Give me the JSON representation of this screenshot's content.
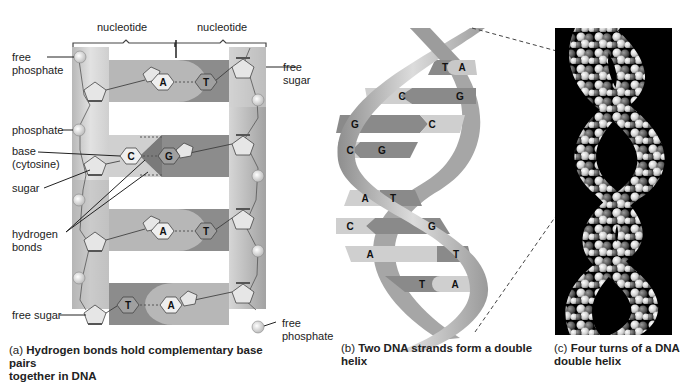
{
  "panel_a": {
    "header_labels": [
      "nucleotide",
      "nucleotide"
    ],
    "left_labels": {
      "free_phosphate": [
        "free",
        "phosphate"
      ],
      "phosphate": "phosphate",
      "base": [
        "base",
        "(cytosine)"
      ],
      "sugar": "sugar",
      "hydrogen_bonds": [
        "hydrogen",
        "bonds"
      ],
      "free_sugar": "free sugar"
    },
    "right_labels": {
      "free_sugar": [
        "free",
        "sugar"
      ],
      "free_phosphate": [
        "free",
        "phosphate"
      ]
    },
    "base_pairs": [
      {
        "left": "A",
        "right": "T"
      },
      {
        "left": "C",
        "right": "G"
      },
      {
        "left": "A",
        "right": "T"
      },
      {
        "left": "T",
        "right": "A"
      }
    ],
    "caption_prefix": "(a)",
    "caption": [
      "Hydrogen bonds hold complementary base pairs",
      "together in DNA"
    ]
  },
  "panel_b": {
    "base_pairs": [
      {
        "left": "T",
        "right": "A"
      },
      {
        "left": "C",
        "right": "G"
      },
      {
        "left": "G",
        "right": "C"
      },
      {
        "left": "C",
        "right": "G"
      },
      {
        "left": "A",
        "right": "T"
      },
      {
        "left": "C",
        "right": "G"
      },
      {
        "left": "A",
        "right": "T"
      },
      {
        "left": "T",
        "right": "A"
      }
    ],
    "caption_prefix": "(b)",
    "caption": [
      "Two DNA strands form a double",
      "helix"
    ]
  },
  "panel_c": {
    "caption_prefix": "(c)",
    "caption": [
      "Four turns of a DNA",
      "double helix"
    ]
  },
  "colors": {
    "backbone_light": "#d8d8d8",
    "backbone_dark": "#a8a8a8",
    "base_light": "#c4c4c4",
    "base_dark": "#8a8a8a",
    "photo_bg": "#000000"
  }
}
